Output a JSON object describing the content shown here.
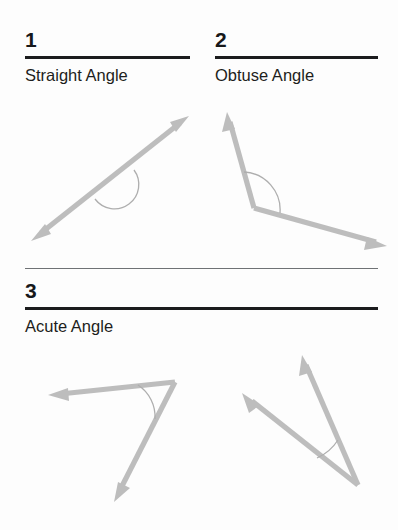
{
  "page": {
    "background_color": "#fdfdfd",
    "text_color": "#1a1a1a",
    "rule_color": "#1b1c1e",
    "thin_rule_color": "#6f7275",
    "arrow_color": "#bdbdbd",
    "arc_color": "#aeaeae"
  },
  "sections": [
    {
      "number": "1",
      "label": "Straight Angle",
      "diagram": "straight-angle-diagram"
    },
    {
      "number": "2",
      "label": "Obtuse Angle",
      "diagram": "obtuse-angle-diagram"
    },
    {
      "number": "3",
      "label": "Acute Angle",
      "diagram": "acute-angle-diagram"
    }
  ],
  "diagrams": {
    "straight": {
      "name": "straight-angle-diagram",
      "description": "double-headed arrow forming a 180 degree line with a semicircular arc below",
      "arrowheads": 2,
      "arc_side": "below"
    },
    "obtuse": {
      "name": "obtuse-angle-diagram",
      "description": "two rays from a vertex opening wider than 90 degrees with an arc marking the interior",
      "arrowheads": 2,
      "arc_side": "interior"
    },
    "acute_left": {
      "name": "acute-angle-diagram-left",
      "description": "two rays from an upper-right vertex forming a narrow angle with a small arc",
      "arrowheads": 2,
      "arc_side": "interior"
    },
    "acute_right": {
      "name": "acute-angle-diagram-right",
      "description": "two rays rising from a bottom vertex forming a narrow angle with a small arc",
      "arrowheads": 2,
      "arc_side": "interior"
    }
  }
}
